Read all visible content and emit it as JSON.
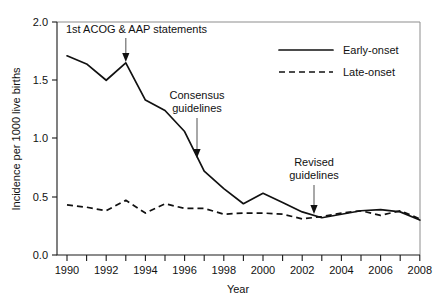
{
  "chart_data": {
    "type": "line",
    "title": "",
    "xlabel": "Year",
    "ylabel": "Incidence per 1000 live births",
    "xlim": [
      1990,
      2008
    ],
    "ylim": [
      0.0,
      2.0
    ],
    "grid": false,
    "legend_position": "top-right",
    "x": [
      1990,
      1991,
      1992,
      1993,
      1994,
      1995,
      1996,
      1997,
      1998,
      1999,
      2000,
      2001,
      2002,
      2003,
      2004,
      2005,
      2006,
      2007,
      2008
    ],
    "xticks": [
      1990,
      1991,
      1992,
      1993,
      1994,
      1995,
      1996,
      1997,
      1998,
      1999,
      2000,
      2001,
      2002,
      2003,
      2004,
      2005,
      2006,
      2007,
      2008
    ],
    "xtick_labels": [
      "1990",
      "",
      "1992",
      "",
      "1994",
      "",
      "1996",
      "",
      "1998",
      "",
      "2000",
      "",
      "2002",
      "",
      "2004",
      "",
      "2006",
      "",
      "2008"
    ],
    "yticks": [
      0.0,
      0.5,
      1.0,
      1.5,
      2.0
    ],
    "ytick_labels": [
      "0.0",
      "0.5",
      "1.0",
      "1.5",
      "2.0"
    ],
    "series": [
      {
        "name": "Early-onset",
        "style": "solid",
        "values": [
          1.71,
          1.64,
          1.5,
          1.65,
          1.33,
          1.24,
          1.06,
          0.72,
          0.57,
          0.44,
          0.53,
          0.45,
          0.37,
          0.32,
          0.35,
          0.38,
          0.39,
          0.37,
          0.3
        ]
      },
      {
        "name": "Late-onset",
        "style": "dashed",
        "values": [
          0.43,
          0.41,
          0.38,
          0.47,
          0.36,
          0.44,
          0.4,
          0.4,
          0.35,
          0.36,
          0.36,
          0.35,
          0.31,
          0.33,
          0.36,
          0.38,
          0.34,
          0.38,
          0.31
        ]
      }
    ],
    "annotations": [
      {
        "text": "1st ACOG & AAP statements",
        "target_x": 1993,
        "target_y": 1.65,
        "arrow": "down"
      },
      {
        "text_line1": "Consensus",
        "text_line2": "guidelines",
        "target_x": 1996.6,
        "target_y": 1.0,
        "arrow": "down"
      },
      {
        "text_line1": "Revised",
        "text_line2": "guidelines",
        "target_x": 2003,
        "target_y": 0.33,
        "arrow": "down"
      }
    ]
  },
  "legend": {
    "items": [
      {
        "label": "Early-onset",
        "style": "solid"
      },
      {
        "label": "Late-onset",
        "style": "dashed"
      }
    ]
  },
  "axes": {
    "y_title": "Incidence per 1000 live births",
    "x_title": "Year",
    "ytick_0": "0.0",
    "ytick_1": "0.5",
    "ytick_2": "1.0",
    "ytick_3": "1.5",
    "ytick_4": "2.0",
    "xtick_1990": "1990",
    "xtick_1992": "1992",
    "xtick_1994": "1994",
    "xtick_1996": "1996",
    "xtick_1998": "1998",
    "xtick_2000": "2000",
    "xtick_2002": "2002",
    "xtick_2004": "2004",
    "xtick_2006": "2006",
    "xtick_2008": "2008"
  },
  "annotations_text": {
    "acog": "1st ACOG & AAP statements",
    "consensus_line1": "Consensus",
    "consensus_line2": "guidelines",
    "revised_line1": "Revised",
    "revised_line2": "guidelines"
  },
  "colors": {
    "series_line": "#111111",
    "axis": "#1a1a1a",
    "frame": "#8d8d8d",
    "arrow": "#6e6e6e",
    "background": "#ffffff"
  }
}
